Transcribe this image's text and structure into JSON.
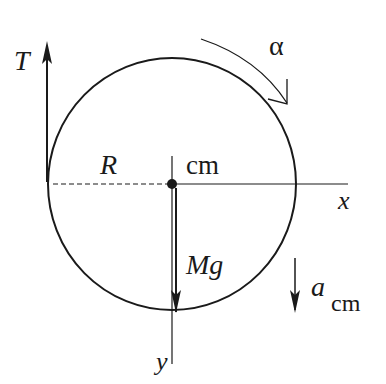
{
  "diagram": {
    "labels": {
      "tension": "T",
      "angular_accel": "α",
      "radius": "R",
      "center_of_mass": "cm",
      "x_axis": "x",
      "y_axis": "y",
      "weight": "Mg",
      "accel_symbol": "a",
      "accel_subscript": "cm"
    },
    "colors": {
      "stroke": "#1a1a1a",
      "background": "#ffffff"
    }
  }
}
